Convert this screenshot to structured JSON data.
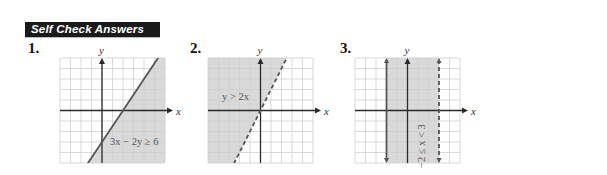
{
  "header": {
    "title": "Self Check Answers"
  },
  "colors": {
    "header_bg": "#1a1a1a",
    "shade": "#d9d9d9",
    "grid": "#cfcfcf",
    "boundary": "#555555"
  },
  "problems": [
    {
      "number": "1.",
      "inequality": "3x − 2y ≥ 6",
      "boundary": "solid",
      "line": {
        "slope": 1.5,
        "intercept": -3
      },
      "shade_side": "below",
      "x_label": "x",
      "y_label": "y",
      "x_range": [
        -4,
        6
      ],
      "y_range": [
        -5,
        5
      ]
    },
    {
      "number": "2.",
      "inequality": "y > 2x",
      "boundary": "dashed",
      "line": {
        "slope": 2,
        "intercept": 0
      },
      "shade_side": "above",
      "x_label": "x",
      "y_label": "y",
      "x_range": [
        -5,
        5
      ],
      "y_range": [
        -5,
        5
      ]
    },
    {
      "number": "3.",
      "inequality": "−2 ≤ x < 3",
      "boundary_left": {
        "x": -2,
        "style": "solid"
      },
      "boundary_right": {
        "x": 3,
        "style": "dashed"
      },
      "shade_side": "between",
      "x_label": "x",
      "y_label": "y",
      "x_range": [
        -5,
        5
      ],
      "y_range": [
        -5,
        5
      ]
    }
  ]
}
